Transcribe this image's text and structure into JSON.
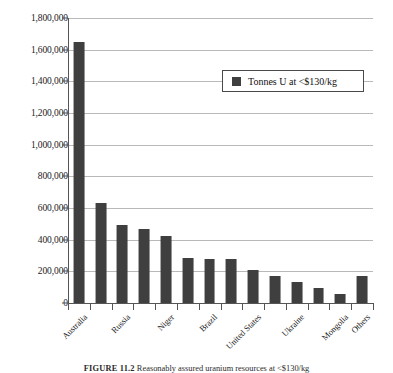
{
  "chart_data": {
    "type": "bar",
    "title": "",
    "xlabel": "",
    "ylabel": "",
    "ylim": [
      0,
      1800000
    ],
    "ytick_step": 200000,
    "grid": true,
    "legend_position": "upper-right-inside",
    "bar_color": "#3f3f3f",
    "grid_color": "#b9b9b9",
    "axis_color": "#555555",
    "series": [
      {
        "name": "Tonnes U at <$130/kg",
        "values": [
          1650000,
          630000,
          490000,
          470000,
          425000,
          285000,
          280000,
          280000,
          210000,
          170000,
          130000,
          95000,
          60000,
          170000
        ]
      }
    ],
    "categories": [
      "Australia",
      "Kazakhstan",
      "Russia",
      "Canada",
      "Niger",
      "Namibia",
      "Brazil",
      "South Africa",
      "United States",
      "China",
      "Ukraine",
      "Uzbekistan",
      "Mongolia",
      "Others"
    ],
    "visible_tick_labels": [
      "Australia",
      "",
      "Russia",
      "",
      "Niger",
      "",
      "Brazil",
      "",
      "United States",
      "",
      "Ukraine",
      "",
      "Mongolia",
      "Others"
    ],
    "ytick_labels": [
      "0",
      "200,000",
      "400,000",
      "600,000",
      "800,000",
      "1,000,000",
      "1,200,000",
      "1,400,000",
      "1,600,000",
      "1,800,000"
    ],
    "ytick_values": [
      0,
      200000,
      400000,
      600000,
      800000,
      1000000,
      1200000,
      1400000,
      1600000,
      1800000
    ]
  },
  "legend": {
    "entry_label": "Tonnes U at <$130/kg"
  },
  "caption": {
    "figure_number": "FIGURE 11.2",
    "text": "Reasonably assured uranium resources at <$130/kg"
  }
}
